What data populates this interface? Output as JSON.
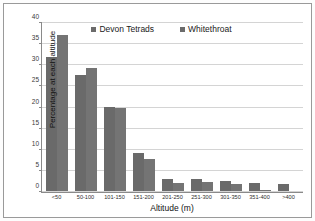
{
  "chart_data": {
    "type": "bar",
    "title": "",
    "xlabel": "Altitude (m)",
    "ylabel": "Percentage at each altitude",
    "categories": [
      "<50",
      "50-100",
      "101-150",
      "151-200",
      "201-250",
      "251-300",
      "301-350",
      "351-400",
      ">400"
    ],
    "series": [
      {
        "name": "Devon Tetrads",
        "color": "#6a6a6a",
        "values": [
          32.0,
          27.7,
          20.0,
          9.1,
          2.9,
          2.9,
          2.4,
          1.9,
          1.7
        ]
      },
      {
        "name": "Whitethroat",
        "color": "#747474",
        "values": [
          37.2,
          29.4,
          19.8,
          7.7,
          2.0,
          2.1,
          1.6,
          0.3,
          0.0
        ]
      }
    ],
    "ylim": [
      0,
      40
    ],
    "yticks": [
      0,
      5,
      10,
      15,
      20,
      25,
      30,
      35,
      40
    ],
    "ytick_labels": [
      "0",
      "5",
      "10",
      "15",
      "20",
      "25",
      "30",
      "35",
      "40"
    ],
    "grid": true,
    "legend_position": "top-center"
  },
  "legend": {
    "entries": [
      {
        "label": "Devon Tetrads",
        "swatch": "legend-swatch-devon-tetrads"
      },
      {
        "label": "Whitethroat",
        "swatch": "legend-swatch-whitethroat"
      }
    ]
  },
  "colors": {
    "bar_series_1": "#6a6a6a",
    "bar_series_2": "#747474",
    "gridline": "#d4d4d4",
    "axis": "#8a8a8a",
    "frame": "#9a9a9a",
    "background": "#ffffff"
  }
}
